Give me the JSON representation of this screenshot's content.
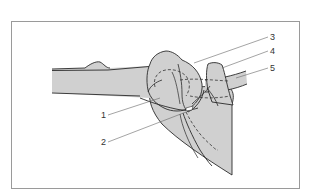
{
  "figure": {
    "type": "anatomical-line-drawing",
    "fill_color": "#d0d0d0",
    "line_color": "#2a2a2a",
    "leader_color": "#555555",
    "frame_color": "#9a9a9a"
  },
  "labels": [
    {
      "id": "1",
      "text": "1",
      "x": 101,
      "y": 111
    },
    {
      "id": "2",
      "text": "2",
      "x": 101,
      "y": 138
    },
    {
      "id": "3",
      "text": "3",
      "x": 270,
      "y": 33
    },
    {
      "id": "4",
      "text": "4",
      "x": 270,
      "y": 47
    },
    {
      "id": "5",
      "text": "5",
      "x": 270,
      "y": 64
    }
  ]
}
